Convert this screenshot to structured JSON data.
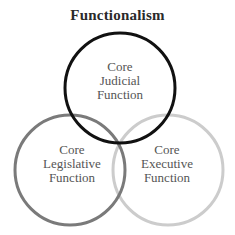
{
  "title": "Functionalism",
  "circles": [
    {
      "id": "judicial",
      "lines": [
        "Core",
        "Judicial",
        "Function"
      ],
      "stroke": "#111111",
      "cx": 120,
      "cy": 88,
      "r": 55,
      "stroke_width": 3
    },
    {
      "id": "legislative",
      "lines": [
        "Core",
        "Legislative",
        "Function"
      ],
      "stroke": "#7a7a7a",
      "cx": 70,
      "cy": 170,
      "r": 55,
      "stroke_width": 3
    },
    {
      "id": "executive",
      "lines": [
        "Core",
        "Executive",
        "Function"
      ],
      "stroke": "#cccccc",
      "cx": 168,
      "cy": 170,
      "r": 55,
      "stroke_width": 3
    }
  ]
}
